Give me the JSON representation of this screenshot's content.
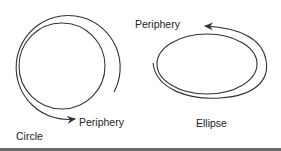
{
  "diagram": {
    "colors": {
      "stroke": "#333333",
      "text": "#222222",
      "rule": "#6a6a6a"
    },
    "circle": {
      "label": "Circle",
      "periphery_label": "Periphery",
      "arrow_direction": "counterclockwise"
    },
    "ellipse": {
      "label": "Ellipse",
      "periphery_label": "Periphery",
      "arrow_direction": "clockwise"
    }
  }
}
